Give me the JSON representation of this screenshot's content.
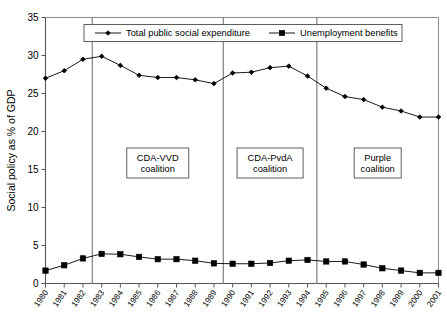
{
  "chart_data": {
    "type": "line",
    "title": "",
    "subtitle": "",
    "xlabel": "",
    "ylabel": "Social policy as % of GDP",
    "ylim": [
      0,
      35
    ],
    "yticks": [
      0,
      5,
      10,
      15,
      20,
      25,
      30,
      35
    ],
    "ytick_labels": [
      "0",
      "5",
      "10",
      "15",
      "20",
      "25",
      "30",
      "35"
    ],
    "grid": false,
    "legend_position": "top-center",
    "x": [
      1980,
      1981,
      1982,
      1983,
      1984,
      1985,
      1986,
      1987,
      1988,
      1989,
      1990,
      1991,
      1992,
      1993,
      1994,
      1995,
      1996,
      1997,
      1998,
      1999,
      2000,
      2001
    ],
    "categories": [
      "1980",
      "1981",
      "1982",
      "1983",
      "1984",
      "1985",
      "1986",
      "1987",
      "1988",
      "1989",
      "1990",
      "1991",
      "1992",
      "1993",
      "1994",
      "1995",
      "1996",
      "1997",
      "1998",
      "1999",
      "2000",
      "2001"
    ],
    "series": [
      {
        "name": "Total public social expenditure",
        "marker": "diamond",
        "color": "#000000",
        "values": [
          27.0,
          28.0,
          29.5,
          29.9,
          28.7,
          27.4,
          27.1,
          27.1,
          26.8,
          26.3,
          27.7,
          27.8,
          28.4,
          28.6,
          27.3,
          25.7,
          24.6,
          24.2,
          23.2,
          22.7,
          21.9,
          21.9
        ]
      },
      {
        "name": "Unemployment benefits",
        "marker": "square",
        "color": "#000000",
        "values": [
          1.7,
          2.4,
          3.3,
          3.9,
          3.85,
          3.5,
          3.2,
          3.2,
          3.0,
          2.65,
          2.6,
          2.6,
          2.7,
          3.0,
          3.1,
          2.9,
          2.9,
          2.5,
          2.0,
          1.7,
          1.4,
          1.4
        ]
      }
    ],
    "annotations": [
      {
        "id": "cda-vvd",
        "line1": "CDA-VVD",
        "line2": "coalition",
        "span_start": 1983,
        "span_end": 1989
      },
      {
        "id": "cda-pvda",
        "line1": "CDA-PvdA",
        "line2": "coalition",
        "span_start": 1990,
        "span_end": 1994
      },
      {
        "id": "purple",
        "line1": "Purple",
        "line2": "coalition",
        "span_start": 1995,
        "span_end": 2001
      }
    ],
    "dividers": [
      1982.5,
      1989.5,
      1994.5
    ]
  },
  "legend": {
    "entries": [
      {
        "label": "Total public social expenditure"
      },
      {
        "label": "Unemployment benefits"
      }
    ]
  }
}
